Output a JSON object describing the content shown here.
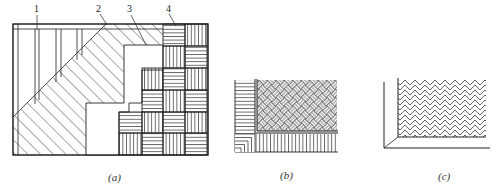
{
  "figure": {
    "panels": [
      {
        "id": "a",
        "caption": "(a)",
        "callouts": [
          "1",
          "2",
          "3",
          "4"
        ]
      },
      {
        "id": "b",
        "caption": "(b)"
      },
      {
        "id": "c",
        "caption": "(c)"
      }
    ]
  },
  "colors": {
    "line": "#222222",
    "background": "#ffffff"
  }
}
